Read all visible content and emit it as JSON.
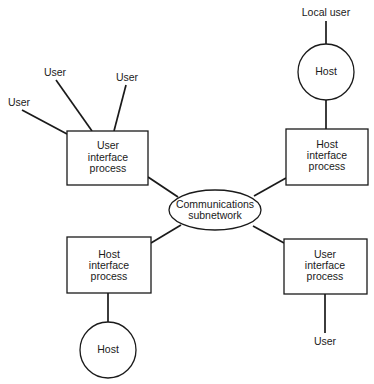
{
  "diagram": {
    "type": "network-topology",
    "center": {
      "id": "comm",
      "shape": "ellipse",
      "lines": [
        "Communications",
        "subnetwork"
      ]
    },
    "nodes": [
      {
        "id": "uip_tl",
        "shape": "rect",
        "lines": [
          "User",
          "interface",
          "process"
        ]
      },
      {
        "id": "hip_tr",
        "shape": "rect",
        "lines": [
          "Host",
          "interface",
          "process"
        ]
      },
      {
        "id": "hip_bl",
        "shape": "rect",
        "lines": [
          "Host",
          "interface",
          "process"
        ]
      },
      {
        "id": "uip_br",
        "shape": "rect",
        "lines": [
          "User",
          "interface",
          "process"
        ]
      },
      {
        "id": "host_tr",
        "shape": "circle",
        "lines": [
          "Host"
        ]
      },
      {
        "id": "host_bl",
        "shape": "circle",
        "lines": [
          "Host"
        ]
      }
    ],
    "labels": {
      "user_1": "User",
      "user_2": "User",
      "user_3": "User",
      "local_user": "Local user",
      "user_br": "User"
    },
    "edges": [
      [
        "user_1",
        "uip_tl"
      ],
      [
        "user_2",
        "uip_tl"
      ],
      [
        "user_3",
        "uip_tl"
      ],
      [
        "uip_tl",
        "comm"
      ],
      [
        "local_user",
        "host_tr"
      ],
      [
        "host_tr",
        "hip_tr"
      ],
      [
        "hip_tr",
        "comm"
      ],
      [
        "hip_bl",
        "comm"
      ],
      [
        "hip_bl",
        "host_bl"
      ],
      [
        "uip_br",
        "comm"
      ],
      [
        "uip_br",
        "user_br"
      ]
    ]
  }
}
